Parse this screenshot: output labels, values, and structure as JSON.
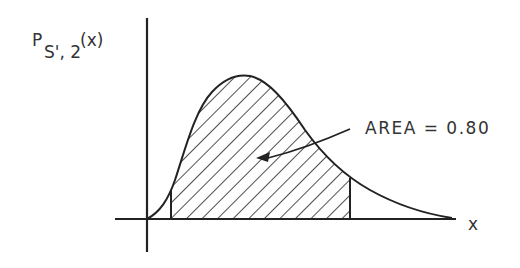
{
  "figure": {
    "y_axis_label": {
      "main": "P",
      "subscript": "S', 2",
      "argument": "(x)"
    },
    "x_axis_label": "x",
    "annotation": "AREA = 0.80",
    "shaded_area_value": 0.8,
    "colors": {
      "line": "#222222",
      "text": "#333333",
      "background": "#ffffff"
    }
  }
}
